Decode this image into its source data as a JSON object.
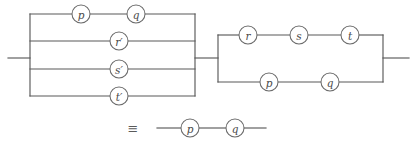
{
  "figure": {
    "kind": "switching-circuit-equivalence-diagram",
    "ink_color": "#595959",
    "background_color": "#ffffff",
    "equivalence_symbol": "≡"
  },
  "networks": [
    {
      "id": "left-network",
      "name": "left-parallel-network",
      "topology": "parallel",
      "branch_count": 4,
      "branches": [
        {
          "id": "branch-pq",
          "topology": "series",
          "elements": [
            {
              "label": "p"
            },
            {
              "label": "q"
            }
          ]
        },
        {
          "id": "branch-r",
          "topology": "series",
          "elements": [
            {
              "label": "r′"
            }
          ]
        },
        {
          "id": "branch-s",
          "topology": "series",
          "elements": [
            {
              "label": "s′"
            }
          ]
        },
        {
          "id": "branch-t",
          "topology": "series",
          "elements": [
            {
              "label": "t′"
            }
          ]
        }
      ]
    },
    {
      "id": "right-network",
      "name": "right-parallel-network",
      "topology": "parallel",
      "branch_count": 2,
      "branches": [
        {
          "id": "branch-rst",
          "topology": "series",
          "elements": [
            {
              "label": "r"
            },
            {
              "label": "s"
            },
            {
              "label": "t"
            }
          ]
        },
        {
          "id": "branch-pq2",
          "topology": "series",
          "elements": [
            {
              "label": "p"
            },
            {
              "label": "q"
            }
          ]
        }
      ]
    },
    {
      "id": "result-network",
      "name": "result-series-network",
      "topology": "series",
      "branch_count": 1,
      "branches": [
        {
          "id": "branch-result-pq",
          "topology": "series",
          "elements": [
            {
              "label": "p"
            },
            {
              "label": "q"
            }
          ]
        }
      ]
    }
  ],
  "labels": {
    "left": {
      "b0_e0": "p",
      "b0_e1": "q",
      "b1_e0": "r′",
      "b2_e0": "s′",
      "b3_e0": "t′"
    },
    "right": {
      "b0_e0": "r",
      "b0_e1": "s",
      "b0_e2": "t",
      "b1_e0": "p",
      "b1_e1": "q"
    },
    "result": {
      "e0": "p",
      "e1": "q"
    }
  }
}
